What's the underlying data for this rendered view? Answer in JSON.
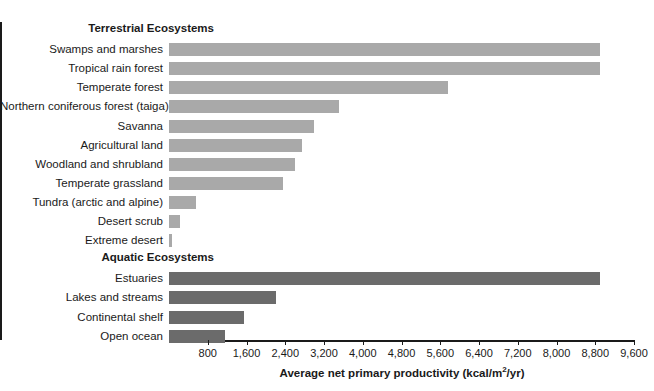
{
  "chart_data": {
    "type": "bar",
    "orientation": "horizontal",
    "title": "",
    "xlabel": "Average net primary productivity (kcal/m2/yr)",
    "ylabel": "",
    "xlim": [
      0,
      9600
    ],
    "grid": false,
    "legend": null,
    "xticks": [
      800,
      1600,
      2400,
      3200,
      4000,
      4800,
      5600,
      6400,
      7200,
      8000,
      8800,
      9600
    ],
    "xtick_labels": [
      "800",
      "1,600",
      "2,400",
      "3,200",
      "4,000",
      "4,800",
      "5,600",
      "6,400",
      "7,200",
      "8,000",
      "8,800",
      "9,600"
    ],
    "group_headers": [
      "Terrestrial Ecosystems",
      "Aquatic Ecosystems"
    ],
    "colors": {
      "terrestrial": "#a9a9a9",
      "aquatic": "#6b6b6b",
      "axis": "#1a1a1a",
      "text": "#1a1a1a",
      "background": "#ffffff"
    },
    "categories": [
      "Swamps and marshes",
      "Tropical rain forest",
      "Temperate forest",
      "Northern coniferous forest (taiga)",
      "Savanna",
      "Agricultural land",
      "Woodland and shrubland",
      "Temperate grassland",
      "Tundra (arctic and alpine)",
      "Desert scrub",
      "Extreme desert",
      "Estuaries",
      "Lakes and streams",
      "Continental shelf",
      "Open ocean"
    ],
    "values": [
      8900,
      8900,
      5750,
      3500,
      3000,
      2750,
      2600,
      2350,
      550,
      225,
      60,
      8900,
      2200,
      1550,
      1150
    ],
    "rows": [
      {
        "kind": "header",
        "label": "Terrestrial Ecosystems"
      },
      {
        "kind": "bar",
        "label": "Swamps and marshes",
        "value": 8900,
        "group": "terrestrial"
      },
      {
        "kind": "bar",
        "label": "Tropical rain forest",
        "value": 8900,
        "group": "terrestrial"
      },
      {
        "kind": "bar",
        "label": "Temperate forest",
        "value": 5750,
        "group": "terrestrial"
      },
      {
        "kind": "bar",
        "label": "Northern coniferous forest (taiga)",
        "value": 3500,
        "group": "terrestrial"
      },
      {
        "kind": "bar",
        "label": "Savanna",
        "value": 3000,
        "group": "terrestrial"
      },
      {
        "kind": "bar",
        "label": "Agricultural land",
        "value": 2750,
        "group": "terrestrial"
      },
      {
        "kind": "bar",
        "label": "Woodland and shrubland",
        "value": 2600,
        "group": "terrestrial"
      },
      {
        "kind": "bar",
        "label": "Temperate grassland",
        "value": 2350,
        "group": "terrestrial"
      },
      {
        "kind": "bar",
        "label": "Tundra (arctic and alpine)",
        "value": 550,
        "group": "terrestrial"
      },
      {
        "kind": "bar",
        "label": "Desert scrub",
        "value": 225,
        "group": "terrestrial"
      },
      {
        "kind": "bar",
        "label": "Extreme desert",
        "value": 60,
        "group": "terrestrial"
      },
      {
        "kind": "header",
        "label": "Aquatic Ecosystems"
      },
      {
        "kind": "bar",
        "label": "Estuaries",
        "value": 8900,
        "group": "aquatic"
      },
      {
        "kind": "bar",
        "label": "Lakes and streams",
        "value": 2200,
        "group": "aquatic"
      },
      {
        "kind": "bar",
        "label": "Continental shelf",
        "value": 1550,
        "group": "aquatic"
      },
      {
        "kind": "bar",
        "label": "Open ocean",
        "value": 1150,
        "group": "aquatic"
      }
    ]
  },
  "axis_title": {
    "main": "Average net primary productivity (kcal/m",
    "sup": "2",
    "tail": "/yr)"
  }
}
